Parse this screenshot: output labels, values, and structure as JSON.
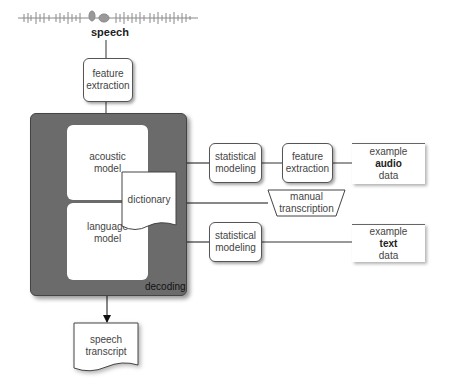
{
  "input": {
    "waveform_icon": "speech-waveform",
    "label": "speech"
  },
  "nodes": {
    "feature_extraction_top": [
      "feature",
      "extraction"
    ],
    "decoding_label": "decoding",
    "acoustic_model": [
      "acoustic",
      "model"
    ],
    "language_model": [
      "language",
      "model"
    ],
    "dictionary": "dictionary",
    "statistical_modeling_audio": [
      "statistical",
      "modeling"
    ],
    "feature_extraction_audio": [
      "feature",
      "extraction"
    ],
    "example_audio_data": [
      "example",
      "audio",
      "data"
    ],
    "manual_transcription": [
      "manual",
      "transcription"
    ],
    "statistical_modeling_text": [
      "statistical",
      "modeling"
    ],
    "example_text_data": [
      "example",
      "text",
      "data"
    ],
    "speech_transcript": [
      "speech",
      "transcript"
    ]
  },
  "colors": {
    "decoding_fill": "#6b6b6b",
    "stroke": "#333333",
    "box_fill": "#ffffff"
  }
}
